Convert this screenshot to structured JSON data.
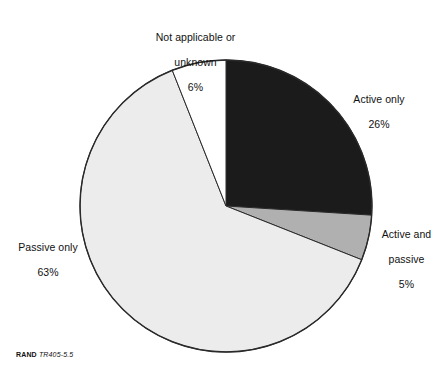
{
  "figure": {
    "source_note_brand": "RAND",
    "source_note_id": "TR405-5.5"
  },
  "labels": {
    "not_applicable": {
      "line1": "Not applicable or",
      "line2": "unknown",
      "value": "6%"
    },
    "active_only": {
      "line1": "Active only",
      "value": "26%"
    },
    "active_and_passive": {
      "line1": "Active and",
      "line2": "passive",
      "value": "5%"
    },
    "passive_only": {
      "line1": "Passive only",
      "value": "63%"
    }
  },
  "chart_data": {
    "type": "pie",
    "title": "",
    "subtitle": "",
    "xlabel": "",
    "ylabel": "",
    "legend_position": "none",
    "grid": false,
    "labels_outside": true,
    "start_angle_deg": 0,
    "direction": "clockwise",
    "center": {
      "x": 226,
      "y": 206
    },
    "radius": 146,
    "categories": [
      "Active only",
      "Active and passive",
      "Passive only",
      "Not applicable or unknown"
    ],
    "values": [
      26,
      5,
      63,
      6
    ],
    "value_labels": [
      "26%",
      "5%",
      "63%",
      "6%"
    ],
    "unit": "percent",
    "total": 100,
    "colors": [
      "#1b1b1b",
      "#b0b0b0",
      "#ececec",
      "#ffffff"
    ],
    "stroke_color": "#2a2a2a",
    "stroke_width": 1,
    "slices": [
      {
        "name": "Active only",
        "value": 26,
        "label": "26%",
        "color": "#1b1b1b",
        "start_deg": 0,
        "end_deg": 93.6
      },
      {
        "name": "Active and passive",
        "value": 5,
        "label": "5%",
        "color": "#b0b0b0",
        "start_deg": 93.6,
        "end_deg": 111.6
      },
      {
        "name": "Passive only",
        "value": 63,
        "label": "63%",
        "color": "#ececec",
        "start_deg": 111.6,
        "end_deg": 338.4
      },
      {
        "name": "Not applicable or unknown",
        "value": 6,
        "label": "6%",
        "color": "#ffffff",
        "start_deg": 338.4,
        "end_deg": 360
      }
    ]
  }
}
